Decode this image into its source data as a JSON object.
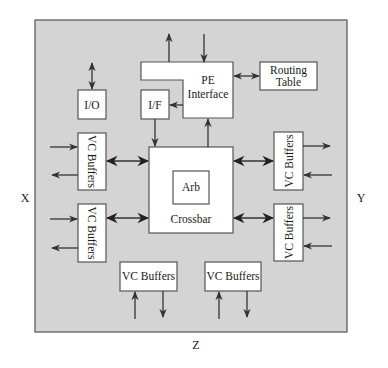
{
  "diagram": {
    "type": "router-block-diagram",
    "blocks": {
      "pe_interface": {
        "line1": "PE",
        "line2": "Interface"
      },
      "routing_table": {
        "line1": "Routing",
        "line2": "Table"
      },
      "io": "I/O",
      "if": "I/F",
      "crossbar": "Crossbar",
      "arb": "Arb",
      "vc_left_top": "VC Buffers",
      "vc_left_bottom": "VC Buffers",
      "vc_right_top": "VC Buffers",
      "vc_right_bottom": "VC Buffers",
      "vc_bottom_left": "VC Buffers",
      "vc_bottom_right": "VC Buffers"
    },
    "axes": {
      "x": "X",
      "y": "Y",
      "z": "Z"
    },
    "colors": {
      "background": "#d4d4d4",
      "block": "#ffffff",
      "stroke": "#333333"
    }
  }
}
